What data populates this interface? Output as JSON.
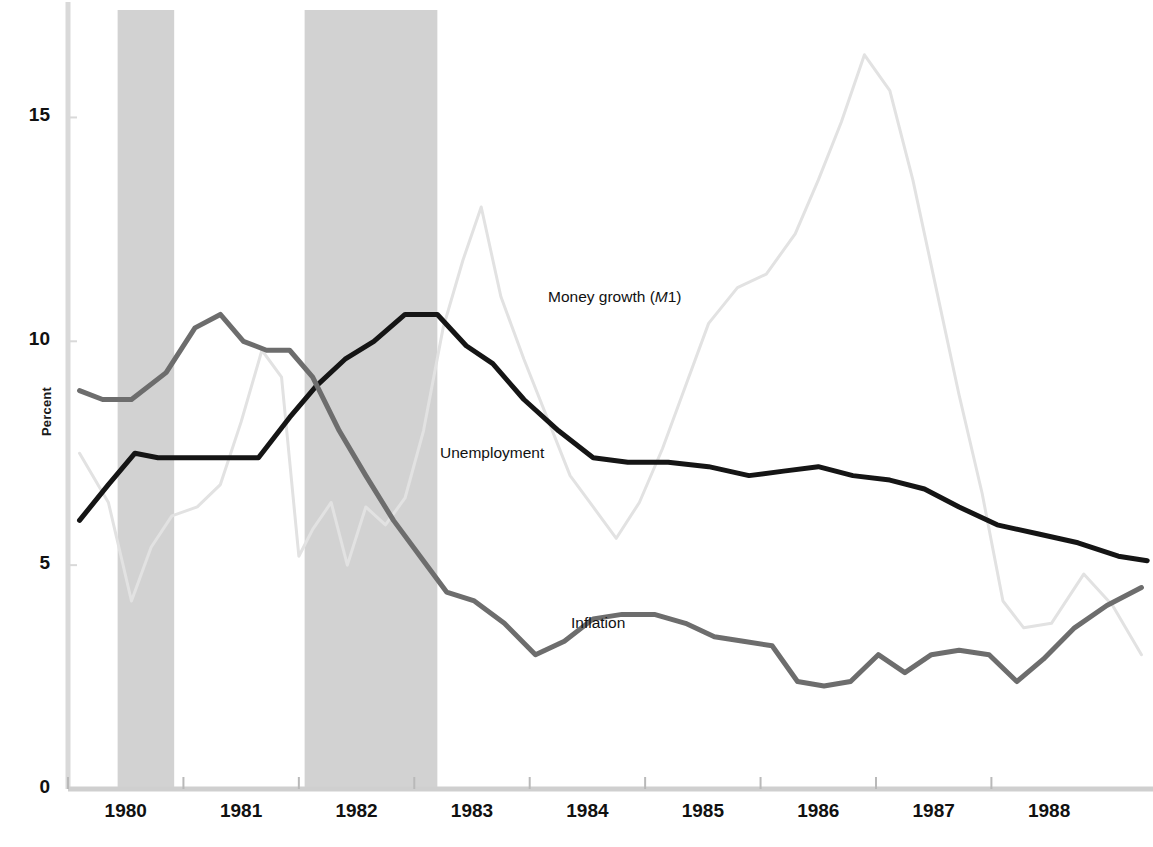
{
  "chart_data": {
    "type": "line",
    "title": "",
    "xlabel": "",
    "ylabel": "Percent",
    "xlim": [
      1979.5,
      1988.9
    ],
    "ylim": [
      0,
      17.4
    ],
    "yticks": [
      0,
      5,
      10,
      15
    ],
    "ytick_labels": [
      "0",
      "5",
      "10",
      "15"
    ],
    "xticks": [
      1980,
      1981,
      1982,
      1983,
      1984,
      1985,
      1986,
      1987,
      1988
    ],
    "xtick_labels": [
      "1980",
      "1981",
      "1982",
      "1983",
      "1984",
      "1985",
      "1986",
      "1987",
      "1988"
    ],
    "grid": false,
    "legend_position": "inline-annotations",
    "shaded_regions": [
      {
        "name": "recession-1980",
        "x0": 1979.93,
        "x1": 1980.42,
        "color": "#d2d2d2"
      },
      {
        "name": "recession-1981-82",
        "x0": 1981.55,
        "x1": 1982.7,
        "color": "#d2d2d2"
      }
    ],
    "series": [
      {
        "name": "Money growth (M1)",
        "label_html": "Money growth (<em>M</em>1)",
        "color": "#e2e2e2",
        "width": 3,
        "x": [
          1979.6,
          1979.85,
          1980.05,
          1980.22,
          1980.4,
          1980.62,
          1980.82,
          1981.0,
          1981.18,
          1981.35,
          1981.5,
          1981.62,
          1981.78,
          1981.92,
          1982.08,
          1982.25,
          1982.42,
          1982.58,
          1982.75,
          1982.92,
          1983.08,
          1983.25,
          1983.45,
          1983.65,
          1983.85,
          1984.05,
          1984.25,
          1984.45,
          1984.65,
          1984.85,
          1985.05,
          1985.3,
          1985.55,
          1985.8,
          1986.0,
          1986.2,
          1986.4,
          1986.62,
          1986.82,
          1987.02,
          1987.22,
          1987.42,
          1987.6,
          1987.78,
          1988.02,
          1988.3,
          1988.55,
          1988.8
        ],
        "y": [
          7.5,
          6.4,
          4.2,
          5.4,
          6.1,
          6.3,
          6.8,
          8.2,
          9.8,
          9.2,
          5.2,
          5.8,
          6.4,
          5.0,
          6.3,
          5.9,
          6.5,
          8.0,
          10.3,
          11.8,
          13.0,
          11.0,
          9.6,
          8.3,
          7.0,
          6.3,
          5.6,
          6.4,
          7.6,
          9.0,
          10.4,
          11.2,
          11.5,
          12.4,
          13.6,
          14.9,
          16.4,
          15.6,
          13.6,
          11.2,
          8.8,
          6.6,
          4.2,
          3.6,
          3.7,
          4.8,
          4.1,
          3.0
        ]
      },
      {
        "name": "Unemployment",
        "label_html": "Unemployment",
        "color": "#151515",
        "width": 5,
        "x": [
          1979.6,
          1979.85,
          1980.08,
          1980.28,
          1980.55,
          1980.85,
          1981.15,
          1981.42,
          1981.65,
          1981.9,
          1982.15,
          1982.42,
          1982.7,
          1982.95,
          1983.18,
          1983.45,
          1983.75,
          1984.05,
          1984.35,
          1984.7,
          1985.05,
          1985.4,
          1985.7,
          1986.0,
          1986.3,
          1986.62,
          1986.92,
          1987.22,
          1987.55,
          1987.9,
          1988.25,
          1988.6,
          1988.85
        ],
        "y": [
          6.0,
          6.8,
          7.5,
          7.4,
          7.4,
          7.4,
          7.4,
          8.3,
          9.0,
          9.6,
          10.0,
          10.6,
          10.6,
          9.9,
          9.5,
          8.7,
          8.0,
          7.4,
          7.3,
          7.3,
          7.2,
          7.0,
          7.1,
          7.2,
          7.0,
          6.9,
          6.7,
          6.3,
          5.9,
          5.7,
          5.5,
          5.2,
          5.1
        ]
      },
      {
        "name": "Inflation",
        "label_html": "Inflation",
        "color": "#6d6d6d",
        "width": 5,
        "x": [
          1979.6,
          1979.8,
          1980.05,
          1980.35,
          1980.6,
          1980.82,
          1981.02,
          1981.22,
          1981.42,
          1981.62,
          1981.85,
          1982.08,
          1982.32,
          1982.55,
          1982.78,
          1983.02,
          1983.28,
          1983.55,
          1983.8,
          1984.05,
          1984.3,
          1984.58,
          1984.85,
          1985.1,
          1985.35,
          1985.6,
          1985.82,
          1986.05,
          1986.28,
          1986.52,
          1986.75,
          1986.98,
          1987.22,
          1987.48,
          1987.72,
          1987.95,
          1988.22,
          1988.5,
          1988.8
        ],
        "y": [
          8.9,
          8.7,
          8.7,
          9.3,
          10.3,
          10.6,
          10.0,
          9.8,
          9.8,
          9.2,
          8.0,
          7.0,
          6.0,
          5.2,
          4.4,
          4.2,
          3.7,
          3.0,
          3.3,
          3.8,
          3.9,
          3.9,
          3.7,
          3.4,
          3.3,
          3.2,
          2.4,
          2.3,
          2.4,
          3.0,
          2.6,
          3.0,
          3.1,
          3.0,
          2.4,
          2.9,
          3.6,
          4.1,
          4.5
        ]
      }
    ],
    "annotations": [
      {
        "name": "money-growth-label",
        "text": "Money growth (M1)",
        "x_px": 548,
        "y_px": 296
      },
      {
        "name": "unemployment-label",
        "text": "Unemployment",
        "x_px": 440,
        "y_px": 452
      },
      {
        "name": "inflation-label",
        "text": "Inflation",
        "x_px": 571,
        "y_px": 622
      }
    ]
  },
  "axes": {
    "y_axis_label": "Percent",
    "y_axis_color": "#d9d9d9",
    "x_axis_color": "#cfcfcf"
  }
}
